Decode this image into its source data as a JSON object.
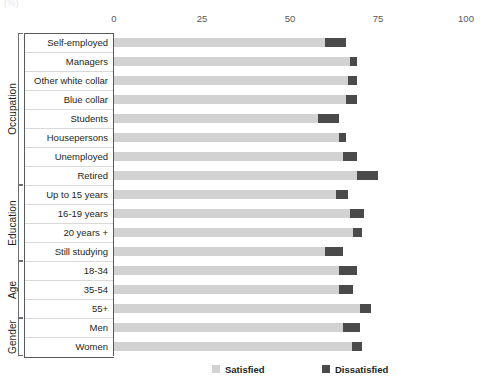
{
  "unit_label": "(%)",
  "axis": {
    "ticks": [
      0,
      25,
      50,
      75,
      100
    ],
    "min": 0,
    "max": 100
  },
  "legend": {
    "satisfied_label": "Satisfied",
    "dissatisfied_label": "Dissatisfied",
    "satisfied_color": "#d2d2d2",
    "dissatisfied_color": "#4a4a4a"
  },
  "groups": [
    {
      "title": "Occupation",
      "rows": [
        {
          "label": "Self-employed",
          "satisfied": 60.0,
          "dissatisfied": 6.0
        },
        {
          "label": "Managers",
          "satisfied": 67.0,
          "dissatisfied": 2.0
        },
        {
          "label": "Other white collar",
          "satisfied": 66.5,
          "dissatisfied": 2.5
        },
        {
          "label": "Blue collar",
          "satisfied": 66.0,
          "dissatisfied": 3.0
        },
        {
          "label": "Students",
          "satisfied": 58.0,
          "dissatisfied": 6.0
        },
        {
          "label": "Housepersons",
          "satisfied": 64.0,
          "dissatisfied": 2.0
        },
        {
          "label": "Unemployed",
          "satisfied": 65.0,
          "dissatisfied": 4.0
        },
        {
          "label": "Retired",
          "satisfied": 69.0,
          "dissatisfied": 6.0
        }
      ]
    },
    {
      "title": "Education",
      "rows": [
        {
          "label": "Up to 15 years",
          "satisfied": 63.0,
          "dissatisfied": 3.5
        },
        {
          "label": "16-19 years",
          "satisfied": 67.0,
          "dissatisfied": 4.0
        },
        {
          "label": "20 years +",
          "satisfied": 68.0,
          "dissatisfied": 2.5
        },
        {
          "label": "Still studying",
          "satisfied": 60.0,
          "dissatisfied": 5.0
        }
      ]
    },
    {
      "title": "Age",
      "rows": [
        {
          "label": "18-34",
          "satisfied": 64.0,
          "dissatisfied": 5.0
        },
        {
          "label": "35-54",
          "satisfied": 64.0,
          "dissatisfied": 4.0
        },
        {
          "label": "55+",
          "satisfied": 70.0,
          "dissatisfied": 3.0
        }
      ]
    },
    {
      "title": "Gender",
      "rows": [
        {
          "label": "Men",
          "satisfied": 65.0,
          "dissatisfied": 5.0
        },
        {
          "label": "Women",
          "satisfied": 67.5,
          "dissatisfied": 3.0
        }
      ]
    }
  ],
  "chart_data": {
    "type": "bar",
    "orientation": "horizontal",
    "stacked": true,
    "title": "",
    "subtitle": "",
    "xlabel": "(%)",
    "ylabel": "",
    "xlim": [
      0,
      100
    ],
    "xticks": [
      0,
      25,
      50,
      75,
      100
    ],
    "grid": false,
    "legend_position": "bottom",
    "categories": [
      "Self-employed",
      "Managers",
      "Other white collar",
      "Blue collar",
      "Students",
      "Housepersons",
      "Unemployed",
      "Retired",
      "Up to 15 years",
      "16-19 years",
      "20 years +",
      "Still studying",
      "18-34",
      "35-54",
      "55+",
      "Men",
      "Women"
    ],
    "category_groups": [
      {
        "name": "Occupation",
        "members": [
          "Self-employed",
          "Managers",
          "Other white collar",
          "Blue collar",
          "Students",
          "Housepersons",
          "Unemployed",
          "Retired"
        ]
      },
      {
        "name": "Education",
        "members": [
          "Up to 15 years",
          "16-19 years",
          "20 years +",
          "Still studying"
        ]
      },
      {
        "name": "Age",
        "members": [
          "18-34",
          "35-54",
          "55+"
        ]
      },
      {
        "name": "Gender",
        "members": [
          "Men",
          "Women"
        ]
      }
    ],
    "series": [
      {
        "name": "Satisfied",
        "color": "#d2d2d2",
        "values": [
          60.0,
          67.0,
          66.5,
          66.0,
          58.0,
          64.0,
          65.0,
          69.0,
          63.0,
          67.0,
          68.0,
          60.0,
          64.0,
          64.0,
          70.0,
          65.0,
          67.5
        ]
      },
      {
        "name": "Dissatisfied",
        "color": "#4a4a4a",
        "values": [
          6.0,
          2.0,
          2.5,
          3.0,
          6.0,
          2.0,
          4.0,
          6.0,
          3.5,
          4.0,
          2.5,
          5.0,
          5.0,
          4.0,
          3.0,
          5.0,
          3.0
        ]
      }
    ]
  }
}
